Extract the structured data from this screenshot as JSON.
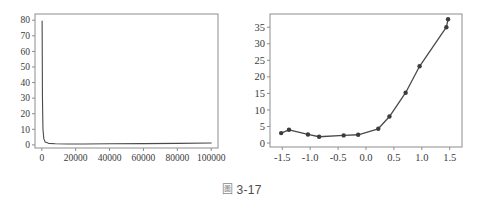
{
  "figure": {
    "caption_glyph": "圖",
    "caption_glyph_name": "cjk-figure-character",
    "caption_text": "3-17"
  },
  "chart_data": [
    {
      "panel": "left",
      "type": "line",
      "title": "",
      "xlabel": "",
      "ylabel": "",
      "xlim": [
        -4000,
        104000
      ],
      "ylim": [
        -2,
        84
      ],
      "xticks": [
        0,
        20000,
        40000,
        60000,
        80000,
        100000
      ],
      "xticklabels": [
        "0",
        "20000",
        "40000",
        "60000",
        "80000",
        "100000"
      ],
      "yticks": [
        0,
        10,
        20,
        30,
        40,
        50,
        60,
        70,
        80
      ],
      "yticklabels": [
        "0",
        "10",
        "20",
        "30",
        "40",
        "50",
        "60",
        "70",
        "80"
      ],
      "grid": false,
      "legend": null,
      "markers": false,
      "x": [
        200,
        400,
        700,
        1200,
        2000,
        4000,
        8000,
        15000,
        25000,
        40000,
        60000,
        80000,
        100000
      ],
      "y": [
        79.5,
        30.0,
        10.0,
        4.0,
        1.8,
        1.0,
        0.7,
        0.6,
        0.6,
        0.7,
        0.8,
        1.0,
        1.2
      ]
    },
    {
      "panel": "right",
      "type": "line",
      "title": "",
      "xlabel": "",
      "ylabel": "",
      "xlim": [
        -1.72,
        1.72
      ],
      "ylim": [
        -1.2,
        39.0
      ],
      "xticks": [
        -1.5,
        -1.0,
        -0.5,
        0.0,
        0.5,
        1.0,
        1.5
      ],
      "xticklabels": [
        "-1.5",
        "-1.0",
        "-0.5",
        "0.0",
        "0.5",
        "1.0",
        "1.5"
      ],
      "yticks": [
        0,
        5,
        10,
        15,
        20,
        25,
        30,
        35
      ],
      "yticklabels": [
        "0",
        "5",
        "10",
        "15",
        "20",
        "25",
        "30",
        "35"
      ],
      "grid": false,
      "legend": null,
      "markers": true,
      "x": [
        -1.52,
        -1.38,
        -1.04,
        -0.84,
        -0.4,
        -0.14,
        0.22,
        0.42,
        0.71,
        0.96,
        1.44,
        1.47
      ],
      "y": [
        3.0,
        4.0,
        2.6,
        1.9,
        2.3,
        2.5,
        4.3,
        8.0,
        15.2,
        23.2,
        35.0,
        37.4
      ]
    }
  ]
}
